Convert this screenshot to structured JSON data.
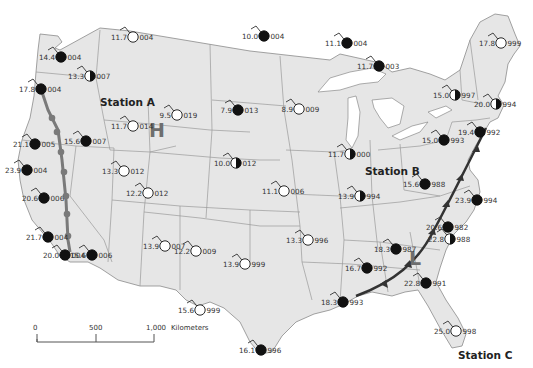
{
  "map": {
    "title": "Weather map - United States surface station observations",
    "colors": {
      "land": "#e6e6e6",
      "ocean": "#ffffff",
      "border": "#8a8a8a",
      "station_fill_dark": "#111111",
      "station_fill_light": "#ffffff",
      "cold_front": "#333333",
      "occluded_front": "#7a7a7a",
      "high_label": "#6e6e6e"
    },
    "labels": {
      "station_a": "Station A",
      "station_b": "Station B",
      "station_c": "Station C",
      "high": "H",
      "low": "L"
    },
    "scale_bar": {
      "ticks": [
        "0",
        "500",
        "1,000"
      ],
      "unit": "Kilometers"
    },
    "stations": [
      {
        "id": "s1",
        "temp": "11.7",
        "pressure": "004",
        "x": 133,
        "y": 37,
        "cover": "clear"
      },
      {
        "id": "s2",
        "temp": "10.0",
        "pressure": "004",
        "x": 264,
        "y": 36,
        "cover": "overcast"
      },
      {
        "id": "s3",
        "temp": "11.1",
        "pressure": "004",
        "x": 347,
        "y": 43,
        "cover": "overcast"
      },
      {
        "id": "s4",
        "temp": "11.7",
        "pressure": "003",
        "x": 379,
        "y": 66,
        "cover": "overcast"
      },
      {
        "id": "s5",
        "temp": "17.8",
        "pressure": "999",
        "x": 501,
        "y": 43,
        "cover": "clear"
      },
      {
        "id": "s6",
        "temp": "14.4",
        "pressure": "004",
        "x": 61,
        "y": 57,
        "cover": "overcast"
      },
      {
        "id": "s7",
        "temp": "13.3",
        "pressure": "007",
        "x": 90,
        "y": 76,
        "cover": "half"
      },
      {
        "id": "s8",
        "temp": "17.8",
        "pressure": "004",
        "x": 41,
        "y": 89,
        "cover": "overcast"
      },
      {
        "id": "s9",
        "temp": "9.5",
        "pressure": "019",
        "x": 177,
        "y": 115,
        "cover": "clear"
      },
      {
        "id": "s10",
        "temp": "7.9",
        "pressure": "013",
        "x": 238,
        "y": 110,
        "cover": "overcast"
      },
      {
        "id": "s11",
        "temp": "8.9",
        "pressure": "009",
        "x": 299,
        "y": 109,
        "cover": "clear"
      },
      {
        "id": "s12",
        "temp": "15.0",
        "pressure": "997",
        "x": 455,
        "y": 95,
        "cover": "half"
      },
      {
        "id": "s13",
        "temp": "20.0",
        "pressure": "994",
        "x": 496,
        "y": 104,
        "cover": "half"
      },
      {
        "id": "s14",
        "temp": "11.7",
        "pressure": "014",
        "x": 133,
        "y": 126,
        "cover": "clear"
      },
      {
        "id": "s15",
        "temp": "21.1",
        "pressure": "005",
        "x": 35,
        "y": 144,
        "cover": "overcast"
      },
      {
        "id": "s16",
        "temp": "15.6",
        "pressure": "007",
        "x": 86,
        "y": 141,
        "cover": "overcast"
      },
      {
        "id": "s17",
        "temp": "23.9",
        "pressure": "004",
        "x": 27,
        "y": 170,
        "cover": "overcast"
      },
      {
        "id": "s18",
        "temp": "13.3",
        "pressure": "012",
        "x": 124,
        "y": 171,
        "cover": "clear"
      },
      {
        "id": "s19",
        "temp": "12.2",
        "pressure": "012",
        "x": 148,
        "y": 193,
        "cover": "clear"
      },
      {
        "id": "s20",
        "temp": "10.0",
        "pressure": "012",
        "x": 236,
        "y": 163,
        "cover": "half"
      },
      {
        "id": "s21",
        "temp": "11.7",
        "pressure": "000",
        "x": 350,
        "y": 154,
        "cover": "half"
      },
      {
        "id": "s22",
        "temp": "15.0",
        "pressure": "993",
        "x": 444,
        "y": 140,
        "cover": "overcast"
      },
      {
        "id": "s23",
        "temp": "19.4",
        "pressure": "992",
        "x": 480,
        "y": 132,
        "cover": "overcast"
      },
      {
        "id": "s24",
        "temp": "11.1",
        "pressure": "006",
        "x": 284,
        "y": 191,
        "cover": "clear"
      },
      {
        "id": "s25",
        "temp": "13.9",
        "pressure": "994",
        "x": 360,
        "y": 196,
        "cover": "half"
      },
      {
        "id": "s26",
        "temp": "15.6",
        "pressure": "988",
        "x": 425,
        "y": 184,
        "cover": "overcast"
      },
      {
        "id": "s27",
        "temp": "20.6",
        "pressure": "006",
        "x": 44,
        "y": 198,
        "cover": "overcast"
      },
      {
        "id": "s28",
        "temp": "23.9",
        "pressure": "994",
        "x": 477,
        "y": 200,
        "cover": "overcast"
      },
      {
        "id": "s29",
        "temp": "20.6",
        "pressure": "982",
        "x": 448,
        "y": 227,
        "cover": "overcast"
      },
      {
        "id": "s30",
        "temp": "22.8",
        "pressure": "988",
        "x": 450,
        "y": 239,
        "cover": "half"
      },
      {
        "id": "s31",
        "temp": "12.2",
        "pressure": "009",
        "x": 196,
        "y": 251,
        "cover": "clear"
      },
      {
        "id": "s32",
        "temp": "13.9",
        "pressure": "007",
        "x": 165,
        "y": 246,
        "cover": "clear"
      },
      {
        "id": "s33",
        "temp": "13.3",
        "pressure": "996",
        "x": 308,
        "y": 240,
        "cover": "clear"
      },
      {
        "id": "s34",
        "temp": "18.3",
        "pressure": "987",
        "x": 396,
        "y": 249,
        "cover": "overcast"
      },
      {
        "id": "s35",
        "temp": "21.7",
        "pressure": "004",
        "x": 48,
        "y": 237,
        "cover": "overcast"
      },
      {
        "id": "s36",
        "temp": "16.7",
        "pressure": "992",
        "x": 367,
        "y": 268,
        "cover": "overcast"
      },
      {
        "id": "s37",
        "temp": "13.9",
        "pressure": "999",
        "x": 245,
        "y": 264,
        "cover": "clear"
      },
      {
        "id": "s38",
        "temp": "22.8",
        "pressure": "991",
        "x": 426,
        "y": 283,
        "cover": "overcast"
      },
      {
        "id": "s39",
        "temp": "20.0",
        "pressure": "004",
        "x": 65,
        "y": 255,
        "cover": "overcast"
      },
      {
        "id": "s40",
        "temp": "15.6",
        "pressure": "006",
        "x": 92,
        "y": 255,
        "cover": "overcast"
      },
      {
        "id": "s41",
        "temp": "15.6",
        "pressure": "999",
        "x": 200,
        "y": 310,
        "cover": "clear"
      },
      {
        "id": "s42",
        "temp": "18.3",
        "pressure": "993",
        "x": 343,
        "y": 302,
        "cover": "overcast"
      },
      {
        "id": "s43",
        "temp": "25.0",
        "pressure": "998",
        "x": 456,
        "y": 331,
        "cover": "clear"
      },
      {
        "id": "s44",
        "temp": "16.1",
        "pressure": "996",
        "x": 261,
        "y": 350,
        "cover": "overcast"
      }
    ]
  }
}
